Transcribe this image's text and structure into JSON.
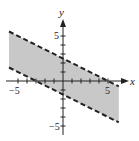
{
  "chart_data": {
    "type": "area",
    "title": "",
    "xlabel": "x",
    "ylabel": "y",
    "xlim": [
      -6,
      6.2
    ],
    "ylim": [
      -6,
      6.5
    ],
    "x_ticks": [
      -5,
      -4,
      -3,
      -2,
      -1,
      1,
      2,
      3,
      4,
      5
    ],
    "y_ticks": [
      -5,
      -4,
      -3,
      -2,
      -1,
      1,
      2,
      3,
      4,
      5
    ],
    "x_tick_labels": {
      "-5": "-5",
      "5": "5"
    },
    "y_tick_labels": {
      "5": "5",
      "-5": "-5"
    },
    "grid": false,
    "series": [
      {
        "name": "upper boundary",
        "style": "dashed",
        "equation": "y = -x/2 + 2.5",
        "x": [
          -6,
          6.2
        ],
        "y": [
          5.5,
          -0.6
        ]
      },
      {
        "name": "lower boundary",
        "style": "dashed",
        "equation": "y = -x/2 - 1.5",
        "x": [
          -6,
          6.2
        ],
        "y": [
          1.5,
          -4.6
        ]
      }
    ],
    "shaded_region": "between the two dashed lines",
    "fill_color": "#c8c8c8",
    "line_color": "#222222"
  },
  "labels": {
    "x_axis": "x",
    "y_axis": "y",
    "x_min": "−5",
    "x_max": "5",
    "y_max": "5",
    "y_min": "−5"
  }
}
